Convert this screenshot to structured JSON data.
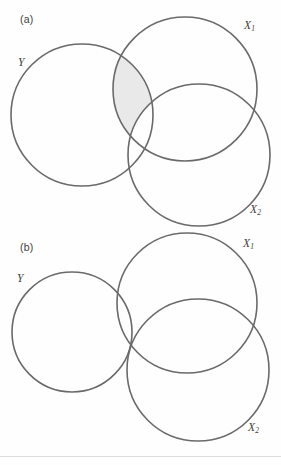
{
  "figure": {
    "type": "venn-diagram-pair",
    "background_color": "#ffffff",
    "stroke_color": "#6a6a6a",
    "shade_color": "#e9e9e9"
  },
  "panels": [
    {
      "id": "a",
      "label": "(a)",
      "label_x": 20,
      "label_y": 13,
      "shaded_description": "Y intersect X1 minus X2",
      "circles": [
        {
          "name": "Y",
          "label": "Y",
          "sub": "",
          "cx": 82,
          "cy": 115,
          "r": 71,
          "label_x": 18,
          "label_y": 56
        },
        {
          "name": "X1",
          "label": "X",
          "sub": "1",
          "cx": 185,
          "cy": 89,
          "r": 72,
          "label_x": 244,
          "label_y": 19
        },
        {
          "name": "X2",
          "label": "X",
          "sub": "2",
          "cx": 199,
          "cy": 155,
          "r": 71,
          "label_x": 250,
          "label_y": 203
        }
      ]
    },
    {
      "id": "b",
      "label": "(b)",
      "label_x": 20,
      "label_y": 9,
      "shaded_description": "Y intersect X1 intersect X2",
      "circles": [
        {
          "name": "Y",
          "label": "Y",
          "sub": "",
          "cx": 72,
          "cy": 100,
          "r": 60,
          "label_x": 17,
          "label_y": 40
        },
        {
          "name": "X1",
          "label": "X",
          "sub": "1",
          "cx": 187,
          "cy": 71,
          "r": 70,
          "label_x": 243,
          "label_y": 5
        },
        {
          "name": "X2",
          "label": "X",
          "sub": "2",
          "cx": 198,
          "cy": 138,
          "r": 71,
          "label_x": 248,
          "label_y": 189
        }
      ]
    }
  ]
}
